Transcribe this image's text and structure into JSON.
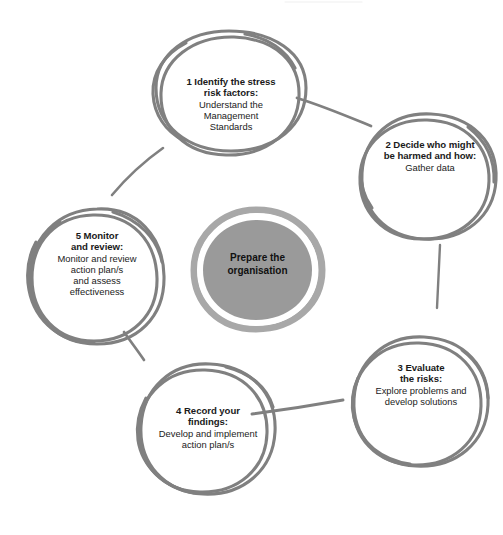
{
  "diagram": {
    "style": "hand-drawn sketch circles",
    "colors": {
      "stroke": "#808080",
      "stroke_dark": "#6e6e6e",
      "center_fill": "#9a9a9a",
      "center_ring": "#a8a8a8",
      "background": "#ffffff",
      "text": "#1a1a1a"
    },
    "center": {
      "line1": "Prepare the",
      "line2": "organisation"
    },
    "steps": [
      {
        "number": "1",
        "title_line1": "1  Identify the stress",
        "title_line2": "risk factors:",
        "desc_line1": "Understand the",
        "desc_line2": "Management",
        "desc_line3": "Standards"
      },
      {
        "number": "2",
        "title_line1": "2  Decide who might",
        "title_line2": "be harmed and how:",
        "desc_line1": "Gather data",
        "desc_line2": "",
        "desc_line3": ""
      },
      {
        "number": "3",
        "title_line1": "3  Evaluate",
        "title_line2": "the risks:",
        "desc_line1": "Explore problems and",
        "desc_line2": "develop solutions",
        "desc_line3": ""
      },
      {
        "number": "4",
        "title_line1": "4  Record your",
        "title_line2": "findings:",
        "desc_line1": "Develop and implement",
        "desc_line2": "action plan/s",
        "desc_line3": ""
      },
      {
        "number": "5",
        "title_line1": "5  Monitor",
        "title_line2": "and review:",
        "desc_line1": "Monitor and review",
        "desc_line2": "action plan/s",
        "desc_line3": "and assess",
        "desc_line4": "effectiveness"
      }
    ]
  }
}
